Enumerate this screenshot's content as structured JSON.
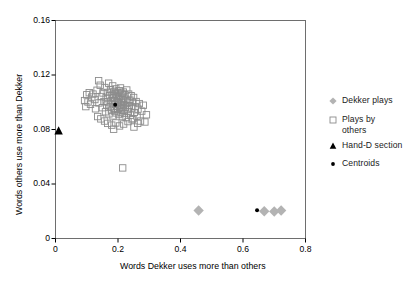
{
  "chart_data": {
    "type": "scatter",
    "title": "",
    "xlabel": "Words Dekker uses more than others",
    "ylabel": "Words others use more than Dekker",
    "xlim": [
      0,
      0.8
    ],
    "ylim": [
      0,
      0.16
    ],
    "xticks": [
      "0",
      "0.2",
      "0.4",
      "0.6",
      "0.8"
    ],
    "xtick_values": [
      0,
      0.2,
      0.4,
      0.6,
      0.8
    ],
    "yticks": [
      "0",
      "0.04",
      "0.08",
      "0.12",
      "0.16"
    ],
    "ytick_values": [
      0,
      0.04,
      0.08,
      0.12,
      0.16
    ],
    "grid": false,
    "legend_position": "right",
    "series": [
      {
        "name": "Dekker plays",
        "marker": "diamond",
        "color": "#b3b3b3",
        "points": [
          [
            0.458,
            0.0205
          ],
          [
            0.668,
            0.02
          ],
          [
            0.7,
            0.0198
          ],
          [
            0.722,
            0.0205
          ]
        ]
      },
      {
        "name": "Plays by others",
        "marker": "open-square",
        "color": "#8c8c8c",
        "points": [
          [
            0.12,
            0.106
          ],
          [
            0.126,
            0.102
          ],
          [
            0.133,
            0.1088
          ],
          [
            0.139,
            0.0995
          ],
          [
            0.143,
            0.1125
          ],
          [
            0.147,
            0.1042
          ],
          [
            0.15,
            0.096
          ],
          [
            0.152,
            0.1068
          ],
          [
            0.155,
            0.1005
          ],
          [
            0.158,
            0.1108
          ],
          [
            0.16,
            0.093
          ],
          [
            0.162,
            0.1035
          ],
          [
            0.164,
            0.098
          ],
          [
            0.166,
            0.1072
          ],
          [
            0.168,
            0.1002
          ],
          [
            0.17,
            0.114
          ],
          [
            0.171,
            0.0915
          ],
          [
            0.173,
            0.1048
          ],
          [
            0.175,
            0.0968
          ],
          [
            0.176,
            0.1092
          ],
          [
            0.178,
            0.101
          ],
          [
            0.179,
            0.0942
          ],
          [
            0.181,
            0.1058
          ],
          [
            0.182,
            0.099
          ],
          [
            0.183,
            0.112
          ],
          [
            0.184,
            0.09
          ],
          [
            0.186,
            0.103
          ],
          [
            0.187,
            0.0955
          ],
          [
            0.188,
            0.108
          ],
          [
            0.189,
            0.1012
          ],
          [
            0.19,
            0.0935
          ],
          [
            0.191,
            0.1062
          ],
          [
            0.192,
            0.0985
          ],
          [
            0.193,
            0.1098
          ],
          [
            0.194,
            0.0922
          ],
          [
            0.195,
            0.104
          ],
          [
            0.196,
            0.097
          ],
          [
            0.197,
            0.105
          ],
          [
            0.198,
            0.1002
          ],
          [
            0.199,
            0.0948
          ],
          [
            0.2,
            0.107
          ],
          [
            0.201,
            0.0995
          ],
          [
            0.202,
            0.1025
          ],
          [
            0.203,
            0.091
          ],
          [
            0.204,
            0.1085
          ],
          [
            0.205,
            0.0962
          ],
          [
            0.206,
            0.1045
          ],
          [
            0.207,
            0.0978
          ],
          [
            0.208,
            0.1105
          ],
          [
            0.209,
            0.0928
          ],
          [
            0.21,
            0.1018
          ],
          [
            0.211,
            0.0952
          ],
          [
            0.212,
            0.1065
          ],
          [
            0.213,
            0.0998
          ],
          [
            0.214,
            0.0895
          ],
          [
            0.215,
            0.1032
          ],
          [
            0.216,
            0.094
          ],
          [
            0.217,
            0.1075
          ],
          [
            0.218,
            0.0982
          ],
          [
            0.219,
            0.1008
          ],
          [
            0.22,
            0.0918
          ],
          [
            0.222,
            0.1055
          ],
          [
            0.223,
            0.0965
          ],
          [
            0.225,
            0.1022
          ],
          [
            0.226,
            0.0888
          ],
          [
            0.228,
            0.109
          ],
          [
            0.229,
            0.0946
          ],
          [
            0.231,
            0.1
          ],
          [
            0.233,
            0.0932
          ],
          [
            0.234,
            0.106
          ],
          [
            0.236,
            0.0975
          ],
          [
            0.238,
            0.1015
          ],
          [
            0.24,
            0.0905
          ],
          [
            0.242,
            0.1048
          ],
          [
            0.244,
            0.0958
          ],
          [
            0.246,
            0.0998
          ],
          [
            0.248,
            0.088
          ],
          [
            0.25,
            0.1035
          ],
          [
            0.252,
            0.0925
          ],
          [
            0.255,
            0.0968
          ],
          [
            0.258,
            0.1005
          ],
          [
            0.261,
            0.0898
          ],
          [
            0.264,
            0.095
          ],
          [
            0.268,
            0.099
          ],
          [
            0.272,
            0.0862
          ],
          [
            0.276,
            0.0935
          ],
          [
            0.281,
            0.0978
          ],
          [
            0.286,
            0.0855
          ],
          [
            0.291,
            0.0908
          ],
          [
            0.1,
            0.1055
          ],
          [
            0.104,
            0.1002
          ],
          [
            0.108,
            0.107
          ],
          [
            0.112,
            0.0985
          ],
          [
            0.116,
            0.1038
          ],
          [
            0.128,
            0.0952
          ],
          [
            0.135,
            0.0895
          ],
          [
            0.145,
            0.0878
          ],
          [
            0.157,
            0.0862
          ],
          [
            0.167,
            0.0845
          ],
          [
            0.18,
            0.0832
          ],
          [
            0.193,
            0.0848
          ],
          [
            0.205,
            0.0826
          ],
          [
            0.218,
            0.084
          ],
          [
            0.232,
            0.0858
          ],
          [
            0.245,
            0.0872
          ],
          [
            0.138,
            0.1158
          ],
          [
            0.186,
            0.0802
          ],
          [
            0.215,
            0.0518
          ],
          [
            0.093,
            0.1012
          ],
          [
            0.097,
            0.0968
          ],
          [
            0.251,
            0.0818
          ],
          [
            0.263,
            0.0845
          ]
        ]
      },
      {
        "name": "Hand-D section",
        "marker": "triangle",
        "color": "#000000",
        "points": [
          [
            0.01,
            0.079
          ]
        ]
      },
      {
        "name": "Centroids",
        "marker": "dot",
        "color": "#000000",
        "points": [
          [
            0.191,
            0.0982
          ],
          [
            0.645,
            0.0208
          ]
        ]
      }
    ]
  },
  "legend": {
    "items": [
      {
        "label": "Dekker plays",
        "marker": "diamond"
      },
      {
        "label": "Plays by\nothers",
        "marker": "open-square"
      },
      {
        "label": "Hand-D section",
        "marker": "triangle"
      },
      {
        "label": "Centroids",
        "marker": "dot"
      }
    ]
  }
}
